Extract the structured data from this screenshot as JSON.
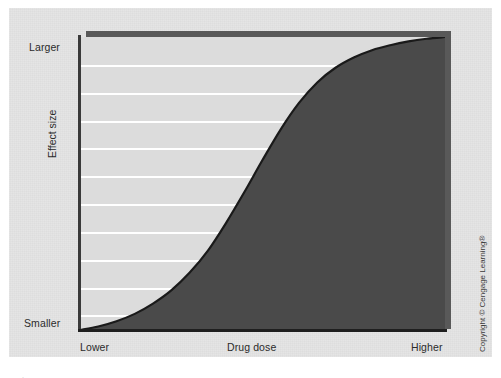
{
  "figure": {
    "background_color": "#e3e3e3",
    "page_background": "#ffffff",
    "corner_mark": "·"
  },
  "copyright": {
    "text": "Copyright © Cengage Learning®"
  },
  "axes": {
    "y_axis_label": "Effect size",
    "y_tick_top": "Larger",
    "y_tick_bottom": "Smaller",
    "x_axis_label": "Drug dose",
    "x_tick_left": "Lower",
    "x_tick_right": "Higher"
  },
  "colors": {
    "plot_background": "#dcdcdc",
    "area_fill": "#4a4a4a",
    "curve_line": "#1a1a1a",
    "gridline": "#ffffff",
    "axis": "#2b2b2b",
    "shadow": "#595959"
  },
  "chart_data": {
    "type": "area",
    "title": "",
    "subtitle": "",
    "xlabel": "Drug dose",
    "ylabel": "Effect size",
    "xlim": [
      0,
      1
    ],
    "ylim": [
      0,
      1
    ],
    "xtick_labels": [
      "Lower",
      "Higher"
    ],
    "ytick_labels": [
      "Smaller",
      "Larger"
    ],
    "grid": true,
    "grid_orientation": "horizontal",
    "gridline_count": 10,
    "gridline_y_fractions": [
      0.095,
      0.19,
      0.285,
      0.38,
      0.475,
      0.57,
      0.665,
      0.76,
      0.855,
      0.95
    ],
    "legend": null,
    "legend_position": "none",
    "annotations": [],
    "series": [
      {
        "name": "Dose-response curve",
        "shape": "sigmoid",
        "fill_below": true,
        "x": [
          0.0,
          0.05,
          0.1,
          0.15,
          0.2,
          0.25,
          0.3,
          0.35,
          0.4,
          0.45,
          0.5,
          0.55,
          0.6,
          0.65,
          0.7,
          0.75,
          0.8,
          0.85,
          0.9,
          0.95,
          1.0
        ],
        "y": [
          0.0,
          0.012,
          0.03,
          0.055,
          0.09,
          0.135,
          0.195,
          0.27,
          0.365,
          0.47,
          0.58,
          0.685,
          0.775,
          0.845,
          0.895,
          0.93,
          0.955,
          0.972,
          0.985,
          0.994,
          1.0
        ]
      }
    ]
  }
}
